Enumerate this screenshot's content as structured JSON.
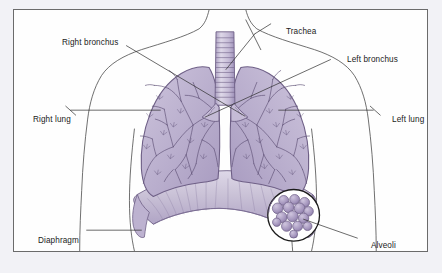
{
  "figure": {
    "background_color": "#f2f2f6",
    "panel_color": "#fefefe",
    "panel_border_color": "#6b6b6b",
    "ink_color": "#1b1b1b"
  },
  "palette": {
    "lung_fill": "#b9aecd",
    "lung_fill_light": "#cdc4dc",
    "lung_outline": "#6e5f86",
    "bronchi_line": "#5d4f75",
    "trachea_fill": "#c5bbd6",
    "diaphragm_fill": "#c9c1d6",
    "body_outline": "#4a4a4a",
    "leader_line": "#2b2b2b",
    "alveoli_fill": "#a495bd",
    "alveoli_highlight": "#cfc5de",
    "inset_ring": "#1b1b1b"
  },
  "labels": [
    {
      "id": "right-bronchus",
      "text": "Right bronchus"
    },
    {
      "id": "trachea",
      "text": "Trachea"
    },
    {
      "id": "left-bronchus",
      "text": "Left bronchus"
    },
    {
      "id": "right-lung",
      "text": "Right lung"
    },
    {
      "id": "left-lung",
      "text": "Left lung"
    },
    {
      "id": "diaphragm",
      "text": "Diaphragm"
    },
    {
      "id": "alveoli",
      "text": "Alveoli"
    }
  ],
  "structures": [
    {
      "name": "trachea",
      "description": "Windpipe with horizontal cartilage rings descending from the neck to the carina"
    },
    {
      "name": "right-lung",
      "description": "Lung on the viewer's left side filled with a branching bronchial tree"
    },
    {
      "name": "left-lung",
      "description": "Lung on the viewer's right side filled with a branching bronchial tree"
    },
    {
      "name": "right-bronchus",
      "description": "Primary airway branching from the carina into the right lung"
    },
    {
      "name": "left-bronchus",
      "description": "Primary airway branching from the carina into the left lung"
    },
    {
      "name": "diaphragm",
      "description": "Dome shaped muscle beneath the lungs with radiating striations"
    },
    {
      "name": "alveoli-inset",
      "description": "Circular magnified view showing a grape-like cluster of alveolar sacs"
    },
    {
      "name": "torso-outline",
      "description": "Faint outline of head, shoulders, arms and waist of a human body"
    }
  ]
}
